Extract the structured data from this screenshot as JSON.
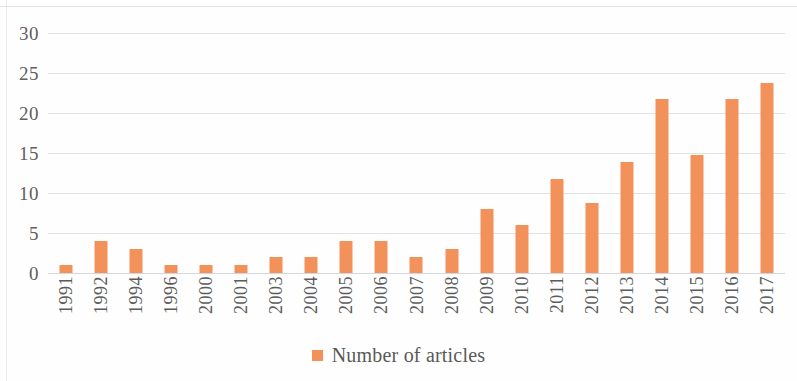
{
  "chart_data": {
    "type": "bar",
    "title": "",
    "subtitle": "",
    "xlabel": "",
    "ylabel": "",
    "ylim": [
      0,
      30
    ],
    "yticks": [
      0,
      5,
      10,
      15,
      20,
      25,
      30
    ],
    "grid": true,
    "legend_position": "bottom",
    "legend": [
      "Number of articles"
    ],
    "series_color": "#F3915A",
    "categories": [
      "1991",
      "1992",
      "1994",
      "1996",
      "2000",
      "2001",
      "2003",
      "2004",
      "2005",
      "2006",
      "2007",
      "2008",
      "2009",
      "2010",
      "2011",
      "2012",
      "2013",
      "2014",
      "2015",
      "2016",
      "2017"
    ],
    "series": [
      {
        "name": "Number of articles",
        "values": [
          1,
          4,
          3,
          1,
          1,
          1,
          2,
          2,
          4,
          4,
          2,
          3,
          8,
          6,
          11.8,
          8.8,
          13.9,
          21.8,
          14.8,
          21.8,
          23.8
        ]
      }
    ]
  },
  "legend": {
    "marker_icon": "square-marker-icon",
    "label": "Number of articles"
  }
}
